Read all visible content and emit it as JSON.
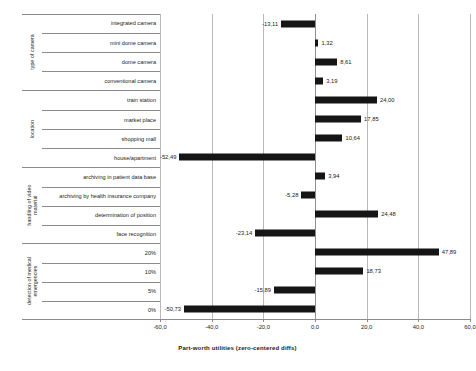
{
  "chart_data": {
    "type": "bar",
    "orientation": "horizontal",
    "title": "",
    "xlabel": "Part-worth utilities (zero-centered diffs)",
    "ylabel": "",
    "xlim": [
      -60.0,
      60.0
    ],
    "xticks": [
      "-60,0",
      "-40,0",
      "-20,0",
      "0,0",
      "20,0",
      "40,0",
      "60,0"
    ],
    "xtick_values": [
      -60,
      -40,
      -20,
      0,
      20,
      40,
      60
    ],
    "grid": true,
    "legend": null,
    "bar_color": "#151515",
    "decimal_separator": ",",
    "groups": [
      {
        "name": "type of camera",
        "lines": [
          "type of camera"
        ],
        "categories": [
          {
            "label": "integrated camera",
            "value": -13.11,
            "display": "-13,11"
          },
          {
            "label": "mini dome camera",
            "value": 1.32,
            "display": "1,32"
          },
          {
            "label": "dome camera",
            "value": 8.61,
            "display": "8,61"
          },
          {
            "label": "conventional camera",
            "value": 3.19,
            "display": "3,19"
          }
        ]
      },
      {
        "name": "location",
        "lines": [
          "location"
        ],
        "categories": [
          {
            "label": "train station",
            "value": 24.0,
            "display": "24,00"
          },
          {
            "label": "market place",
            "value": 17.85,
            "display": "17,85"
          },
          {
            "label": "shopping mall",
            "value": 10.64,
            "display": "10,64"
          },
          {
            "label": "house/apartment",
            "value": -52.49,
            "display": "-52,49"
          }
        ]
      },
      {
        "name": "handling of video material",
        "lines": [
          "handling of video",
          "material"
        ],
        "categories": [
          {
            "label": "archiving in patient data base",
            "value": 3.94,
            "display": "3,94"
          },
          {
            "label": "archiving by health insurance company",
            "value": -5.28,
            "display": "-5,28"
          },
          {
            "label": "determination of position",
            "value": 24.48,
            "display": "24,48"
          },
          {
            "label": "face recognition",
            "value": -23.14,
            "display": "-23,14"
          }
        ]
      },
      {
        "name": "detection of medical emergencies",
        "lines": [
          "detection of medical",
          "emergencies"
        ],
        "categories": [
          {
            "label": "20%",
            "value": 47.89,
            "display": "47,89"
          },
          {
            "label": "10%",
            "value": 18.73,
            "display": "18,73"
          },
          {
            "label": "5%",
            "value": -15.89,
            "display": "-15,89"
          },
          {
            "label": "0%",
            "value": -50.73,
            "display": "-50,73"
          }
        ]
      }
    ]
  }
}
